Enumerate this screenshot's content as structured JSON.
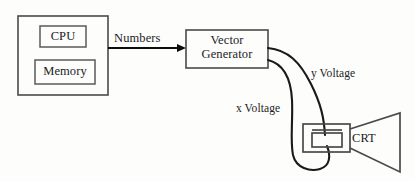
{
  "diagram": {
    "background_color": "#fdfdfc",
    "line_color": "#4a4a4a",
    "wire_color": "#1a1a1a",
    "text_color": "#1c1c1c"
  },
  "nodes": {
    "computer_box": {
      "label": "",
      "x": 18,
      "y": 16,
      "width": 90,
      "height": 79
    },
    "cpu": {
      "label": "CPU",
      "x": 40,
      "y": 26,
      "width": 46,
      "height": 21
    },
    "memory": {
      "label": "Memory",
      "x": 35,
      "y": 60,
      "width": 60,
      "height": 24
    },
    "vector_generator": {
      "label": "Vector Generator",
      "line1": "Vector",
      "line2": "Generator",
      "x": 186,
      "y": 30,
      "width": 82,
      "height": 38
    },
    "crt": {
      "label": "CRT",
      "neck_x": 303,
      "neck_y": 124,
      "neck_width": 47,
      "neck_height": 28,
      "plate_x": 312,
      "plate_y": 133,
      "plate_width": 30,
      "plate_height": 14,
      "funnel_right_x": 400,
      "funnel_top_y": 113,
      "funnel_bottom_y": 172
    }
  },
  "edges": {
    "numbers_arrow": {
      "label": "Numbers",
      "from": "computer_box",
      "to": "vector_generator",
      "start_x": 108,
      "start_y": 48,
      "end_x": 186,
      "end_y": 48
    },
    "x_voltage_wire": {
      "label": "x Voltage",
      "from": "vector_generator",
      "to": "crt"
    },
    "y_voltage_wire": {
      "label": "y Voltage",
      "from": "vector_generator",
      "to": "crt"
    }
  },
  "icons": {
    "arrow_right": "arrow-right-icon",
    "crt_funnel": "crt-funnel-icon",
    "deflection_plates": "deflection-plates-icon"
  }
}
